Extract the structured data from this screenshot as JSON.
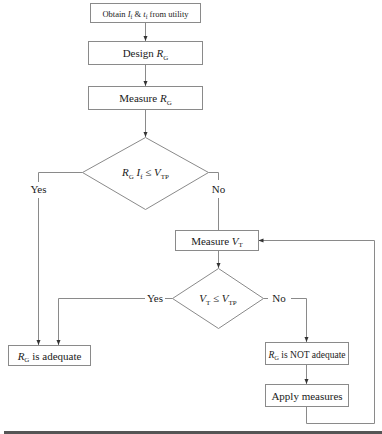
{
  "diagram": {
    "type": "flowchart",
    "nodes": {
      "obtain": {
        "shape": "process",
        "text_pre": "Obtain ",
        "var1": "I",
        "sub1": "f",
        "mid": " & ",
        "var2": "t",
        "sub2": "f",
        "text_post": " from utility"
      },
      "design": {
        "shape": "process",
        "text": "Design ",
        "var": "R",
        "sub": "G"
      },
      "measure_rg": {
        "shape": "process",
        "text": "Measure ",
        "var": "R",
        "sub": "G"
      },
      "decision1": {
        "shape": "decision",
        "var1": "R",
        "sub1": "G",
        "var2": "I",
        "sub2": "f",
        "op": " ≤ ",
        "var3": "V",
        "sub3": "TP"
      },
      "measure_vt": {
        "shape": "process",
        "text": "Measure ",
        "var": "V",
        "sub": "T"
      },
      "decision2": {
        "shape": "decision",
        "var1": "V",
        "sub1": "T",
        "op": " ≤ ",
        "var2": "V",
        "sub2": "TP"
      },
      "adequate": {
        "shape": "process",
        "var": "R",
        "sub": "G",
        "text": " is adequate"
      },
      "not_adequate": {
        "shape": "process",
        "var": "R",
        "sub": "G",
        "text": " is NOT adequate"
      },
      "apply": {
        "shape": "process",
        "text": "Apply measures"
      }
    },
    "edge_labels": {
      "d1_yes": "Yes",
      "d1_no": "No",
      "d2_yes": "Yes",
      "d2_no": "No"
    },
    "edges": [
      [
        "obtain",
        "design"
      ],
      [
        "design",
        "measure_rg"
      ],
      [
        "measure_rg",
        "decision1"
      ],
      [
        "decision1",
        "adequate",
        "Yes"
      ],
      [
        "decision1",
        "measure_vt",
        "No"
      ],
      [
        "measure_vt",
        "decision2"
      ],
      [
        "decision2",
        "adequate",
        "Yes"
      ],
      [
        "decision2",
        "not_adequate",
        "No"
      ],
      [
        "not_adequate",
        "apply"
      ],
      [
        "apply",
        "measure_vt"
      ]
    ],
    "colors": {
      "stroke": "#8a8a8a",
      "text": "#1a1a1a",
      "rule": "#444444"
    }
  }
}
